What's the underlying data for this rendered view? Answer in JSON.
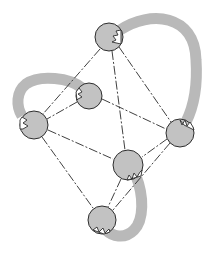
{
  "diagram": {
    "type": "graph",
    "colors": {
      "node_fill": "#c2c2c2",
      "node_stroke": "#2e2e2e",
      "band": "#b9b9b9",
      "edge": "#2a2a2a",
      "background": "#ffffff"
    },
    "nodes": [
      {
        "id": "A",
        "x": 109,
        "y": 37,
        "r": 14
      },
      {
        "id": "B",
        "x": 89,
        "y": 96,
        "r": 13
      },
      {
        "id": "C",
        "x": 34,
        "y": 125,
        "r": 14
      },
      {
        "id": "D",
        "x": 180,
        "y": 133,
        "r": 14
      },
      {
        "id": "E",
        "x": 128,
        "y": 165,
        "r": 15
      },
      {
        "id": "F",
        "x": 102,
        "y": 220,
        "r": 14
      }
    ],
    "edges": [
      [
        "A",
        "C"
      ],
      [
        "A",
        "E"
      ],
      [
        "A",
        "D"
      ],
      [
        "B",
        "C"
      ],
      [
        "B",
        "D"
      ],
      [
        "C",
        "E"
      ],
      [
        "C",
        "F"
      ],
      [
        "D",
        "E"
      ],
      [
        "D",
        "F"
      ],
      [
        "E",
        "F"
      ]
    ],
    "bands": [
      {
        "from": "A",
        "to": "D",
        "shape": "arc-right"
      },
      {
        "from": "B",
        "to": "C",
        "shape": "arc-left"
      },
      {
        "from": "E",
        "to": "F",
        "shape": "j-hook"
      }
    ]
  }
}
